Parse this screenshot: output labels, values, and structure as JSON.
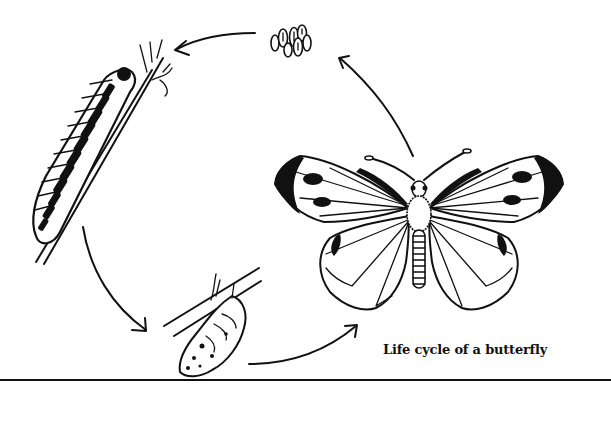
{
  "diagram": {
    "title": "Life cycle of a butterfly",
    "stages": [
      {
        "name": "eggs",
        "label": ""
      },
      {
        "name": "caterpillar",
        "label": ""
      },
      {
        "name": "pupa",
        "label": ""
      },
      {
        "name": "adult butterfly",
        "label": ""
      }
    ],
    "arrows": [
      {
        "from": "eggs",
        "to": "caterpillar"
      },
      {
        "from": "caterpillar",
        "to": "pupa"
      },
      {
        "from": "pupa",
        "to": "adult butterfly"
      },
      {
        "from": "adult butterfly",
        "to": "eggs"
      }
    ],
    "colors": {
      "ink": "#111111",
      "background": "#ffffff"
    }
  }
}
